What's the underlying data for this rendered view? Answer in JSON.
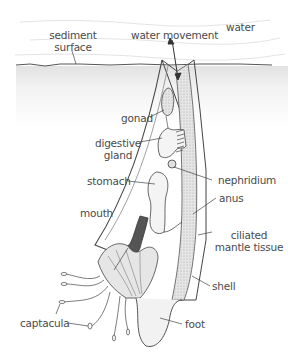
{
  "diagram": {
    "labels": {
      "water": "water",
      "sediment_surface_1": "sediment",
      "sediment_surface_2": "surface",
      "water_movement": "water movement",
      "gonad": "gonad",
      "digestive_gland_1": "digestive",
      "digestive_gland_2": "gland",
      "stomach": "stomach",
      "nephridium": "nephridium",
      "anus": "anus",
      "mouth": "mouth",
      "ciliated_mantle_tissue_1": "ciliated",
      "ciliated_mantle_tissue_2": "mantle tissue",
      "shell": "shell",
      "captacula": "captacula",
      "foot": "foot"
    },
    "colors": {
      "line": "#3a3a3a",
      "sediment_fill": "#ececec",
      "organ_fill": "#f4f4f4",
      "mantle_fill": "#d8d8d8",
      "text": "#4a4a4a"
    }
  }
}
